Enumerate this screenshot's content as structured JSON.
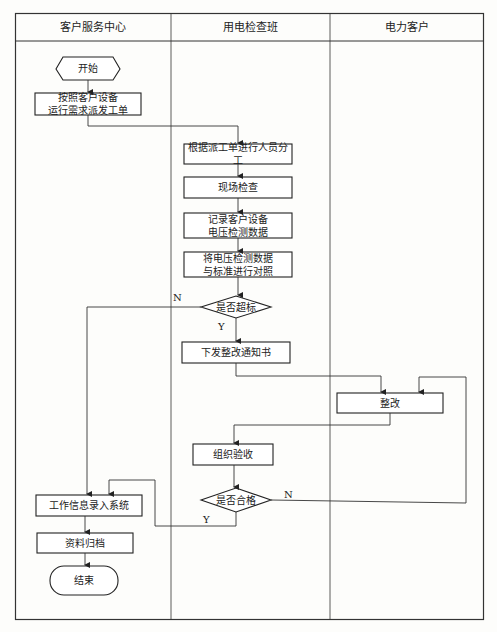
{
  "lanes": [
    {
      "title": "客户服务中心"
    },
    {
      "title": "用电检查班"
    },
    {
      "title": "电力客户"
    }
  ],
  "nodes": {
    "start": {
      "label": "开始",
      "shape": "hexagon"
    },
    "dispatch": {
      "label": "按照客户设备\n运行需求派发工单",
      "shape": "process"
    },
    "assign": {
      "label": "根据派工单进行人员分工",
      "shape": "process"
    },
    "inspect": {
      "label": "现场检查",
      "shape": "process"
    },
    "record": {
      "label": "记录客户设备\n电压检测数据",
      "shape": "process"
    },
    "compare": {
      "label": "将电压检测数据\n与标准进行对照",
      "shape": "process"
    },
    "exceed": {
      "label": "是否超标",
      "shape": "decision"
    },
    "notice": {
      "label": "下发整改通知书",
      "shape": "process"
    },
    "rectify": {
      "label": "整改",
      "shape": "process"
    },
    "accept": {
      "label": "组织验收",
      "shape": "process"
    },
    "qualified": {
      "label": "是否合格",
      "shape": "decision"
    },
    "entry": {
      "label": "工作信息录入系统",
      "shape": "process"
    },
    "archive": {
      "label": "资料归档",
      "shape": "process"
    },
    "end": {
      "label": "结束",
      "shape": "terminator"
    }
  },
  "edge_labels": {
    "exceed_no": "N",
    "exceed_yes": "Y",
    "qualified_no": "N",
    "qualified_yes": "Y"
  }
}
